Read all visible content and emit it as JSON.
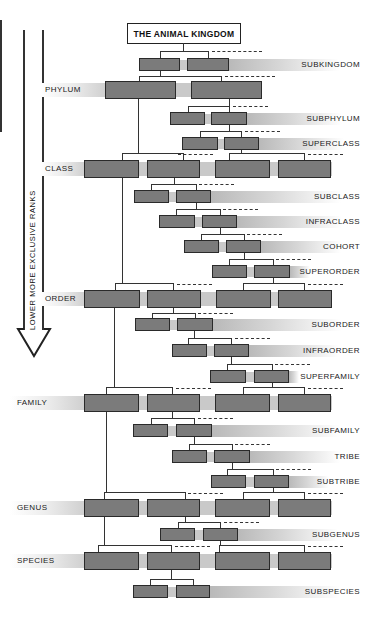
{
  "title": "THE ANIMAL KINGDOM",
  "arrow_label": "LOWER MORE EXCLUSIVE RANKS",
  "colors": {
    "box_fill": "#7b7b7b",
    "box_border": "#2a2a2a",
    "band_gray": "#c9c9c9",
    "line": "#333333",
    "background": "#ffffff"
  },
  "major_ranks": [
    {
      "label": "PHYLUM"
    },
    {
      "label": "CLASS"
    },
    {
      "label": "ORDER"
    },
    {
      "label": "FAMILY"
    },
    {
      "label": "GENUS"
    },
    {
      "label": "SPECIES"
    }
  ],
  "minor_ranks": [
    {
      "label": "SUBKINGDOM"
    },
    {
      "label": "SUBPHYLUM"
    },
    {
      "label": "SUPERCLASS"
    },
    {
      "label": "SUBCLASS"
    },
    {
      "label": "INFRACLASS"
    },
    {
      "label": "COHORT"
    },
    {
      "label": "SUPERORDER"
    },
    {
      "label": "SUBORDER"
    },
    {
      "label": "INFRAORDER"
    },
    {
      "label": "SUPERFAMILY"
    },
    {
      "label": "SUBFAMILY"
    },
    {
      "label": "TRIBE"
    },
    {
      "label": "SUBTRIBE"
    },
    {
      "label": "SUBGENUS"
    },
    {
      "label": "SUBSPECIES"
    }
  ]
}
